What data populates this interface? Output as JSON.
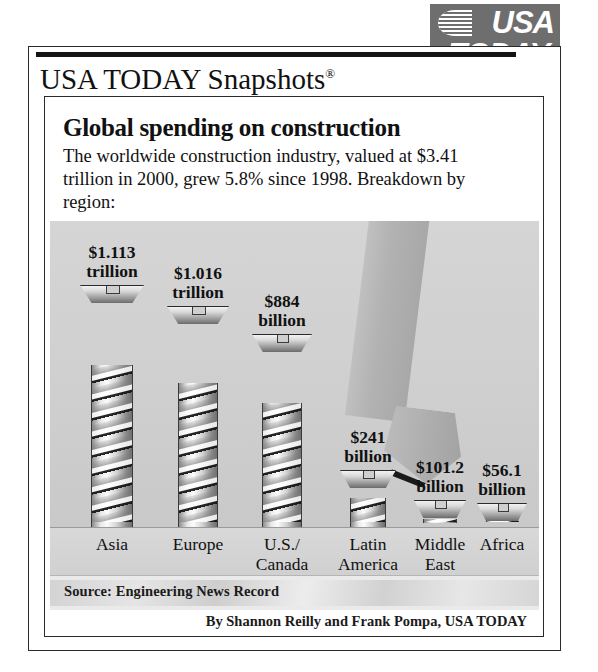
{
  "brand": {
    "logo_line1": "USA",
    "logo_line2": "TODAY.",
    "section_title": "USA TODAY Snapshots",
    "registered_mark": "®"
  },
  "headline": "Global spending on construction",
  "subtext": "The worldwide construction industry, valued at $3.41 trillion in 2000, grew 5.8% since 1998. Breakdown by region:",
  "source": "Source: Engineering News Record",
  "byline": "By Shannon Reilly and Frank Pompa, USA TODAY",
  "icons": {
    "screwdriver": "screwdriver-icon",
    "screw": "screw-icon",
    "globe": "globe-icon"
  },
  "colors": {
    "logo_background": "#6e6e6e",
    "plot_background": "#d0d0d0",
    "frame": "#2a2a2a",
    "text": "#111111",
    "tip": "#1a1a1a"
  },
  "chart_data": {
    "type": "bar",
    "title": "Global spending on construction",
    "subtitle": "The worldwide construction industry, valued at $3.41 trillion in 2000, grew 5.8% since 1998. Breakdown by region:",
    "xlabel": "",
    "ylabel": "Spending",
    "unit": "US dollars",
    "total": "$3.41 trillion",
    "growth_since_1998": "5.8%",
    "year": "2000",
    "grid": false,
    "legend": false,
    "categories": [
      "Asia",
      "Europe",
      "U.S./Canada",
      "Latin America",
      "Middle East",
      "Africa"
    ],
    "category_lines": [
      [
        "Asia"
      ],
      [
        "Europe"
      ],
      [
        "U.S./",
        "Canada"
      ],
      [
        "Latin",
        "America"
      ],
      [
        "Middle",
        "East"
      ],
      [
        "Africa"
      ]
    ],
    "value_labels": [
      [
        "$1.113",
        "trillion"
      ],
      [
        "$1.016",
        "trillion"
      ],
      [
        "$884",
        "billion"
      ],
      [
        "$241",
        "billion"
      ],
      [
        "$101.2",
        "billion"
      ],
      [
        "$56.1",
        "billion"
      ]
    ],
    "values": [
      1113,
      1016,
      884,
      241,
      101.2,
      56.1
    ],
    "values_display": [
      "$1.113 trillion",
      "$1.016 trillion",
      "$884 billion",
      "$241 billion",
      "$101.2 billion",
      "$56.1 billion"
    ],
    "ylim": [
      0,
      1200
    ]
  }
}
